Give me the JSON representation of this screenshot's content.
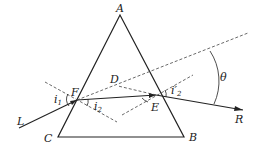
{
  "diagram": {
    "points": {
      "A": {
        "label": "A",
        "x": 120,
        "y": 15
      },
      "B": {
        "label": "B",
        "x": 184,
        "y": 137
      },
      "C": {
        "label": "C",
        "x": 58,
        "y": 137
      },
      "F": {
        "label": "F",
        "x": 77,
        "y": 100
      },
      "E": {
        "label": "E",
        "x": 156,
        "y": 95
      },
      "D": {
        "label": "D"
      },
      "L": {
        "label": "L"
      },
      "R": {
        "label": "R"
      }
    },
    "angles": {
      "i1": {
        "main": "i",
        "sub": "1"
      },
      "i2": {
        "main": "i",
        "sub": "2"
      },
      "i2p": {
        "main": "i′",
        "sub": "2"
      },
      "theta": {
        "main": "θ"
      }
    },
    "colors": {
      "line": "#222222",
      "dashed": "#444444"
    }
  }
}
